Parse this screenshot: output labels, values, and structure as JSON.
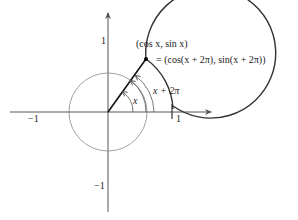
{
  "diagram": {
    "type": "unit-circle-periodicity",
    "axes": {
      "x_tick_pos": "1",
      "x_tick_neg": "−1",
      "y_tick_pos": "1",
      "y_tick_neg": "−1"
    },
    "point_label_line1": "(cos x, sin x)",
    "point_label_line2": "= (cos(x + 2π), sin(x + 2π))",
    "angle_label_small": "x",
    "angle_label_large": "x + 2π",
    "colors": {
      "outer_circle": "#333333",
      "inner_circle": "#888888",
      "axes": "#555555",
      "radius": "#111111"
    }
  }
}
